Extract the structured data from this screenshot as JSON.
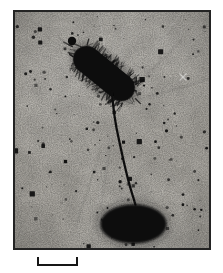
{
  "window": {
    "background": "#ffffff"
  },
  "micrograph": {
    "frame": {
      "left": 13,
      "top": 10,
      "width": 198,
      "height": 240,
      "border_width": 2,
      "border_color": "#232323"
    },
    "film": {
      "base_color": "#b1aea7",
      "grain_dark_opacity": 0.3,
      "grain_light_opacity": 0.16,
      "mottle_opacity": 0.14
    },
    "viewbox": [
      0,
      0,
      194,
      236
    ],
    "bacterium": {
      "center": [
        89,
        61.5
      ],
      "angle_deg": 39,
      "half_length": 36,
      "half_width": 13.5,
      "body_color": "#0b0b0b",
      "halo_color": "rgba(25,25,25,0.30)",
      "fimbriae": {
        "count": 130,
        "end_tufts": 16,
        "seed": 9,
        "min_len": 3.5,
        "max_len": 11,
        "rgb": "12,12,12"
      }
    },
    "satellite_particle": {
      "cx": 57,
      "cy": 29,
      "r": 4.2,
      "color": "#101010"
    },
    "stalk": {
      "path": "M97,80 C98,95 101,115 104,128 C107,142 112,165 116,178 C118,185 119.5,189 120.5,193",
      "color": "#0f0f0f",
      "width": 2.3
    },
    "bead": {
      "cx": 118.5,
      "cy": 212,
      "rx": 33,
      "ry": 19.5,
      "color": "#0a0a0a",
      "halo_color": "rgba(20,20,20,0.35)"
    },
    "speckles": {
      "count": 160,
      "big_count": 14,
      "seed": 7,
      "min_r": 0.4,
      "max_r": 1.7,
      "rgb": "10,10,10"
    },
    "streaks": {
      "count": 20,
      "seed": 5,
      "origin": [
        100,
        95
      ]
    },
    "scratch": {
      "x": 168,
      "y": 65,
      "len": 7,
      "color": "rgba(255,255,255,0.45)"
    }
  },
  "scale_bar": {
    "left": 37,
    "top": 257,
    "width": 41,
    "height": 9,
    "thickness": 2,
    "color": "#161616"
  }
}
